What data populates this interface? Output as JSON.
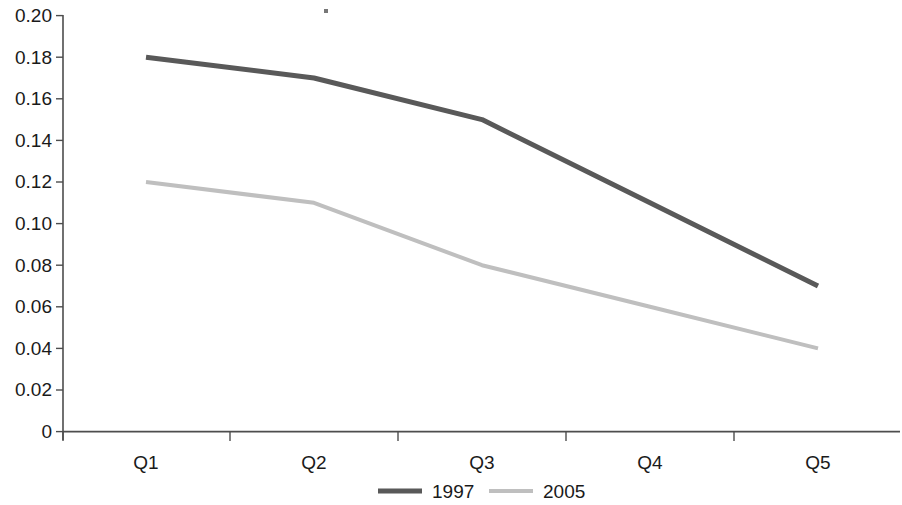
{
  "chart_data": {
    "type": "line",
    "title": "",
    "subtitle": "",
    "xlabel": "",
    "ylabel": "",
    "categories": [
      "Q1",
      "Q2",
      "Q3",
      "Q4",
      "Q5"
    ],
    "series": [
      {
        "name": "1997",
        "values": [
          0.18,
          0.17,
          0.15,
          0.11,
          0.07
        ],
        "color": "#595959"
      },
      {
        "name": "2005",
        "values": [
          0.12,
          0.11,
          0.08,
          0.06,
          0.04
        ],
        "color": "#bfbfbf"
      }
    ],
    "ylim": [
      0,
      0.2
    ],
    "ytick_labels": [
      "0.20",
      "0.18",
      "0.16",
      "0.14",
      "0.12",
      "0.10",
      "0.08",
      "0.06",
      "0.04",
      "0.02",
      "0"
    ],
    "ytick_values": [
      0.2,
      0.18,
      0.16,
      0.14,
      0.12,
      0.1,
      0.08,
      0.06,
      0.04,
      0.02,
      0
    ],
    "grid": false,
    "legend_position": "bottom",
    "legend": [
      {
        "label": "1997",
        "color": "#595959",
        "line_width": 5
      },
      {
        "label": "2005",
        "color": "#bfbfbf",
        "line_width": 4
      }
    ],
    "annotations": []
  },
  "axes": {
    "y_axis_name": "value-axis",
    "x_axis_name": "quarter-axis"
  }
}
